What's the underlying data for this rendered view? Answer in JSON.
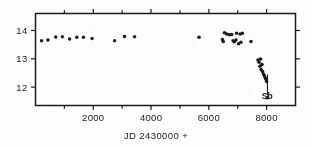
{
  "figure": {
    "background_color": "#fdfdfc",
    "ink_color": "#1a1a1a",
    "annotation": "Sb"
  },
  "chart_data": {
    "type": "scatter",
    "title": "",
    "subtitle": "",
    "xlabel": "JD 2430000 +",
    "ylabel": "",
    "xlim": [
      0,
      9000
    ],
    "ylim": [
      14.6,
      11.35
    ],
    "y_inverted": true,
    "grid": false,
    "legend": null,
    "xticks": [
      2000,
      4000,
      6000,
      8000
    ],
    "xtick_labels": [
      "2000",
      "4000",
      "6000",
      "8000"
    ],
    "x_minor_ticks": [
      1000,
      3000,
      5000,
      7000
    ],
    "yticks": [
      12,
      13,
      14
    ],
    "ytick_labels": [
      "12",
      "13",
      "14"
    ],
    "marker": "filled-circle",
    "marker_color": "#1a1a1a",
    "annotations": [
      {
        "text": "Sb",
        "x": 8020,
        "y": 11.58,
        "name": "sb-label"
      }
    ],
    "errorbars": [
      {
        "x": 8030,
        "y_top": 11.72,
        "y_bottom": 12.45,
        "arrow": "up",
        "name": "upper-limit-arrow"
      }
    ],
    "points": [
      {
        "x": 210,
        "y": 13.64
      },
      {
        "x": 430,
        "y": 13.66
      },
      {
        "x": 700,
        "y": 13.77
      },
      {
        "x": 930,
        "y": 13.78
      },
      {
        "x": 1180,
        "y": 13.7
      },
      {
        "x": 1430,
        "y": 13.76
      },
      {
        "x": 1660,
        "y": 13.76
      },
      {
        "x": 1960,
        "y": 13.72
      },
      {
        "x": 2740,
        "y": 13.64
      },
      {
        "x": 3080,
        "y": 13.79
      },
      {
        "x": 3430,
        "y": 13.78
      },
      {
        "x": 5660,
        "y": 13.76
      },
      {
        "x": 6470,
        "y": 13.68
      },
      {
        "x": 6500,
        "y": 13.61
      },
      {
        "x": 6540,
        "y": 13.92
      },
      {
        "x": 6620,
        "y": 13.88
      },
      {
        "x": 6710,
        "y": 13.85
      },
      {
        "x": 6790,
        "y": 13.86
      },
      {
        "x": 6840,
        "y": 13.64
      },
      {
        "x": 6880,
        "y": 13.6
      },
      {
        "x": 6940,
        "y": 13.66
      },
      {
        "x": 6960,
        "y": 13.9
      },
      {
        "x": 7030,
        "y": 13.53
      },
      {
        "x": 7080,
        "y": 13.88
      },
      {
        "x": 7110,
        "y": 13.58
      },
      {
        "x": 7160,
        "y": 13.9
      },
      {
        "x": 7460,
        "y": 13.61
      },
      {
        "x": 7700,
        "y": 12.96
      },
      {
        "x": 7740,
        "y": 12.88
      },
      {
        "x": 7770,
        "y": 12.74
      },
      {
        "x": 7790,
        "y": 12.99
      },
      {
        "x": 7810,
        "y": 12.62
      },
      {
        "x": 7840,
        "y": 12.8
      },
      {
        "x": 7860,
        "y": 12.55
      },
      {
        "x": 7890,
        "y": 12.46
      },
      {
        "x": 7920,
        "y": 12.4
      },
      {
        "x": 7950,
        "y": 12.33
      },
      {
        "x": 7980,
        "y": 12.28
      },
      {
        "x": 8000,
        "y": 12.2
      }
    ]
  }
}
